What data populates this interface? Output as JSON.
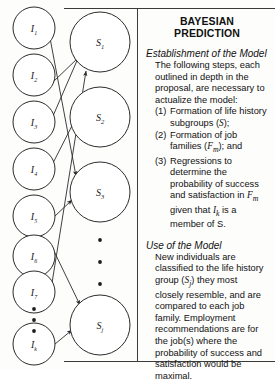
{
  "figure": {
    "panel_title": "BAYESIAN PREDICTION",
    "sections": [
      {
        "heading": "Establishment of the Model",
        "intro": "The following steps, each outlined in depth in the proposal, are necessary to actualize the model:",
        "items": [
          {
            "marker": "(1)",
            "text": "Formation of life history subgroups (S);"
          },
          {
            "marker": "(2)",
            "text": "Formation of job families (Fm); and"
          },
          {
            "marker": "(3)",
            "text": "Regressions to determine the probability of success and satisfaction in Fm given that Ik is a member of S."
          }
        ]
      },
      {
        "heading": "Use of the Model",
        "intro": "New individuals are classified to the life history group (Sj) they most closely resemble, and are compared to each job family. Employment recommendations are for the job(s) where the probability of success and satisfaction would be maximal.",
        "items": []
      }
    ]
  },
  "chart_data": {
    "type": "diagram",
    "left_column_label": "I",
    "right_column_label": "S",
    "left_nodes": [
      {
        "id": "I1",
        "base": "I",
        "sub": "1",
        "cx": 34,
        "cy": 28,
        "r": 21
      },
      {
        "id": "I2",
        "base": "I",
        "sub": "2",
        "cx": 34,
        "cy": 75,
        "r": 21
      },
      {
        "id": "I3",
        "base": "I",
        "sub": "3",
        "cx": 34,
        "cy": 122,
        "r": 21
      },
      {
        "id": "I4",
        "base": "I",
        "sub": "4",
        "cx": 34,
        "cy": 169,
        "r": 21
      },
      {
        "id": "I5",
        "base": "I",
        "sub": "5",
        "cx": 34,
        "cy": 216,
        "r": 21
      },
      {
        "id": "I6",
        "base": "I",
        "sub": "6",
        "cx": 34,
        "cy": 256,
        "r": 21
      },
      {
        "id": "I7",
        "base": "I",
        "sub": "7",
        "cx": 34,
        "cy": 292,
        "r": 21
      },
      {
        "id": "Ik",
        "base": "I",
        "sub": "k",
        "cx": 34,
        "cy": 344,
        "r": 21
      }
    ],
    "right_nodes": [
      {
        "id": "S1",
        "base": "S",
        "sub": "1",
        "cx": 100,
        "cy": 42,
        "r": 30
      },
      {
        "id": "S2",
        "base": "S",
        "sub": "2",
        "cx": 100,
        "cy": 117,
        "r": 30
      },
      {
        "id": "S3",
        "base": "S",
        "sub": "3",
        "cx": 100,
        "cy": 192,
        "r": 30
      },
      {
        "id": "Sj",
        "base": "S",
        "sub": "j",
        "cx": 100,
        "cy": 325,
        "r": 30
      }
    ],
    "left_ellipsis": [
      {
        "cx": 34,
        "cy": 309
      },
      {
        "cx": 34,
        "cy": 320
      },
      {
        "cx": 34,
        "cy": 331
      }
    ],
    "right_ellipsis": [
      {
        "cx": 100,
        "cy": 240
      },
      {
        "cx": 100,
        "cy": 262
      },
      {
        "cx": 100,
        "cy": 284
      }
    ],
    "edges": [
      {
        "from": "I1",
        "to": "S3",
        "x1": 50,
        "y1": 38,
        "x2": 76,
        "y2": 176
      },
      {
        "from": "I2",
        "to": "S1",
        "x1": 53,
        "y1": 82,
        "x2": 79,
        "y2": 57
      },
      {
        "from": "I3",
        "to": "S1",
        "x1": 53,
        "y1": 116,
        "x2": 79,
        "y2": 56
      },
      {
        "from": "I4",
        "to": "S2",
        "x1": 53,
        "y1": 163,
        "x2": 79,
        "y2": 112
      },
      {
        "from": "I5",
        "to": "S3",
        "x1": 55,
        "y1": 216,
        "x2": 72,
        "y2": 200
      },
      {
        "from": "I6",
        "to": "Sj",
        "x1": 52,
        "y1": 247,
        "x2": 80,
        "y2": 305
      },
      {
        "from": "I7",
        "to": "S1",
        "x1": 52,
        "y1": 283,
        "x2": 86,
        "y2": 71
      },
      {
        "from": "Ik",
        "to": "Sj",
        "x1": 55,
        "y1": 344,
        "x2": 72,
        "y2": 330
      }
    ]
  }
}
